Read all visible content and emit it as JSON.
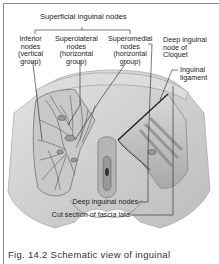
{
  "figure": {
    "title": "Superficial inguinal nodes",
    "labels": {
      "inferior": [
        "Inferior",
        "nodes",
        "(vertical",
        "group)"
      ],
      "superolateral": [
        "Superolateral",
        "nodes",
        "(horizontal",
        "group)"
      ],
      "superomedial": [
        "Superomedial",
        "nodes",
        "(horizontal",
        "group)"
      ],
      "deep_cloquet": [
        "Deep inguinal",
        "node of",
        "Cloquet"
      ],
      "inguinal_ligament": [
        "Inguinal",
        "ligament"
      ],
      "deep_nodes": "Deep inguinal nodes",
      "fascia_lata": "Cut section of fascia lata"
    },
    "caption": "Fig. 14.2 Schematic view of inguinal"
  }
}
